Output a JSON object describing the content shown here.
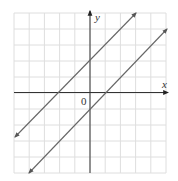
{
  "chart_data": {
    "type": "line",
    "title": "",
    "xlabel": "x",
    "ylabel": "y",
    "origin_label": "0",
    "xlim": [
      -5,
      5
    ],
    "ylim": [
      -5,
      5
    ],
    "grid": true,
    "grid_step": 1,
    "tick_labels_shown": false,
    "series": [
      {
        "name": "y = x + 2",
        "slope": 1,
        "intercept": 2,
        "x": [
          -5,
          3
        ],
        "y": [
          -3,
          5
        ],
        "arrows": "both"
      },
      {
        "name": "y = x - 1",
        "slope": 1,
        "intercept": -1,
        "x": [
          -4,
          5
        ],
        "y": [
          -5,
          4
        ],
        "arrows": "both"
      }
    ],
    "colors": {
      "grid": "#dddddd",
      "axes": "#333333",
      "lines": "#666666"
    }
  }
}
